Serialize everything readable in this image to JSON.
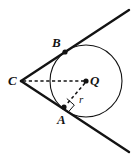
{
  "figure": {
    "name": "circle-with-two-tangent-lines-from-external-point",
    "width": 133,
    "height": 161,
    "background_color": "#ffffff",
    "stroke_color": "#131313"
  },
  "labels": {
    "center_point": "Q",
    "tangent_point_upper": "B",
    "tangent_point_lower": "A",
    "external_point": "C",
    "radius_segment": "r"
  },
  "geometry": {
    "circle": {
      "center_x": 86,
      "center_y": 81,
      "radius": 36,
      "stroke_width": 1.1
    },
    "points": {
      "Q": {
        "x": 86,
        "y": 81,
        "dot_radius": 2.6
      },
      "B": {
        "x": 65,
        "y": 52,
        "dot_radius": 2.6
      },
      "A": {
        "x": 64,
        "y": 107,
        "dot_radius": 2.6
      },
      "C": {
        "x": 21,
        "y": 81,
        "dot_radius": 0
      }
    },
    "tangent_line_upper": {
      "x1": 21,
      "y1": 81,
      "x2": 129,
      "y2": 10,
      "stroke_width": 2.4
    },
    "tangent_line_lower": {
      "x1": 21,
      "y1": 81,
      "x2": 129,
      "y2": 152,
      "stroke_width": 2.4
    },
    "dashed_segment_CQ": {
      "x1": 23,
      "y1": 81,
      "x2": 84,
      "y2": 81,
      "stroke_width": 1.5,
      "dash": "3.2,2.6"
    },
    "dashed_segment_QA": {
      "x1": 85,
      "y1": 83,
      "x2": 66,
      "y2": 105,
      "stroke_width": 1.5,
      "dash": "3.2,2.6"
    },
    "right_angle_marker": {
      "points": "66.8,98.6 74.3,105.1 67.8,112.6",
      "size": 7,
      "stroke_width": 1.0
    }
  },
  "label_positions": {
    "B": {
      "left": 52,
      "top": 36
    },
    "C": {
      "left": 8,
      "top": 74
    },
    "Q": {
      "left": 90,
      "top": 74
    },
    "A": {
      "left": 57,
      "top": 113
    },
    "r": {
      "left": 79,
      "top": 94
    }
  }
}
